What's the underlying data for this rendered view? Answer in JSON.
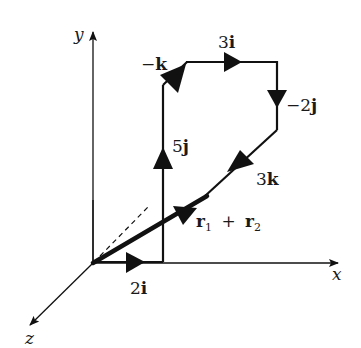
{
  "diagram": {
    "axes": {
      "x_label": "x",
      "y_label": "y",
      "z_label": "z"
    },
    "vectors": [
      {
        "id": "2i",
        "coef": "2",
        "unit": "i",
        "label": "2i"
      },
      {
        "id": "5j",
        "coef": "5",
        "unit": "j",
        "label": "5j"
      },
      {
        "id": "-k",
        "coef": "−",
        "unit": "k",
        "label": "−k"
      },
      {
        "id": "3i",
        "coef": "3",
        "unit": "i",
        "label": "3i"
      },
      {
        "id": "-2j",
        "coef": "−2",
        "unit": "j",
        "label": "−2j"
      },
      {
        "id": "3k",
        "coef": "3",
        "unit": "k",
        "label": "3k"
      }
    ],
    "resultant": {
      "r": "r",
      "sub1": "1",
      "plus": "+",
      "sub2": "2",
      "label": "r1 + r2"
    },
    "colors": {
      "line": "#111111",
      "background": "#ffffff"
    }
  }
}
